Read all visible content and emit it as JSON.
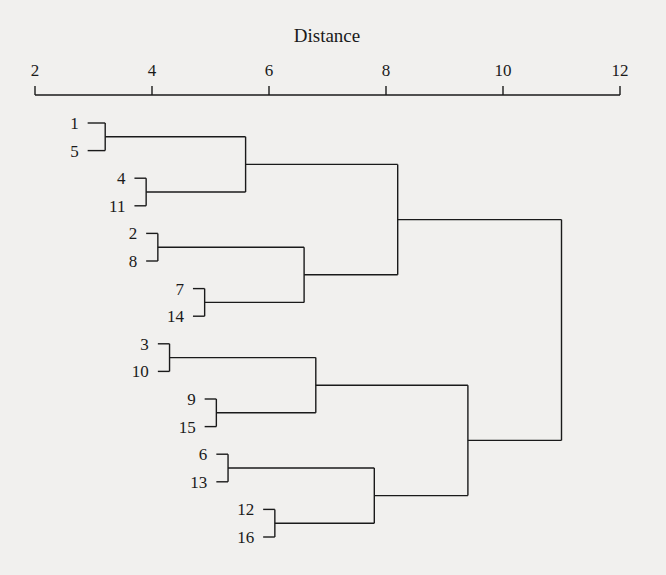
{
  "chart_data": {
    "type": "dendrogram",
    "title": "",
    "xlabel": "Distance",
    "ylabel": "",
    "orientation": "horizontal",
    "xlim": [
      2,
      12
    ],
    "xticks": [
      2,
      4,
      6,
      8,
      10,
      12
    ],
    "axis_position": "top",
    "leaves": [
      "1",
      "5",
      "4",
      "11",
      "2",
      "8",
      "7",
      "14",
      "3",
      "10",
      "9",
      "15",
      "6",
      "13",
      "12",
      "16"
    ],
    "merges": [
      {
        "id": "A",
        "children": [
          "1",
          "5"
        ],
        "distance": 3.2
      },
      {
        "id": "B",
        "children": [
          "4",
          "11"
        ],
        "distance": 3.9
      },
      {
        "id": "C",
        "children": [
          "A",
          "B"
        ],
        "distance": 5.6
      },
      {
        "id": "D",
        "children": [
          "2",
          "8"
        ],
        "distance": 4.1
      },
      {
        "id": "E",
        "children": [
          "7",
          "14"
        ],
        "distance": 4.9
      },
      {
        "id": "F",
        "children": [
          "D",
          "E"
        ],
        "distance": 6.6
      },
      {
        "id": "G",
        "children": [
          "C",
          "F"
        ],
        "distance": 8.2
      },
      {
        "id": "H",
        "children": [
          "3",
          "10"
        ],
        "distance": 4.3
      },
      {
        "id": "I",
        "children": [
          "9",
          "15"
        ],
        "distance": 5.1
      },
      {
        "id": "J",
        "children": [
          "H",
          "I"
        ],
        "distance": 6.8
      },
      {
        "id": "K",
        "children": [
          "6",
          "13"
        ],
        "distance": 5.3
      },
      {
        "id": "L",
        "children": [
          "12",
          "16"
        ],
        "distance": 6.1
      },
      {
        "id": "M",
        "children": [
          "K",
          "L"
        ],
        "distance": 7.8
      },
      {
        "id": "N",
        "children": [
          "J",
          "M"
        ],
        "distance": 9.4
      },
      {
        "id": "ROOT",
        "children": [
          "G",
          "N"
        ],
        "distance": 11.0
      }
    ],
    "leaf_start": {
      "1": 2.9,
      "5": 2.9,
      "4": 3.7,
      "11": 3.7,
      "2": 3.9,
      "8": 3.9,
      "7": 4.7,
      "14": 4.7,
      "3": 4.1,
      "10": 4.1,
      "9": 4.9,
      "15": 4.9,
      "6": 5.1,
      "13": 5.1,
      "12": 5.9,
      "16": 5.9
    },
    "root_tail_to": 11.0
  },
  "colors": {
    "background": "#f1f0ee",
    "ink": "#1a1a1a"
  }
}
